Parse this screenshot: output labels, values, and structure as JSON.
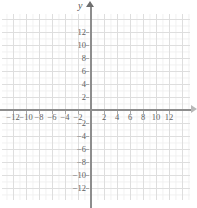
{
  "figure": {
    "kind": "coordinate-plane",
    "axis_label_y": "y",
    "axis_label_x": ""
  },
  "chart_data": {
    "type": "scatter",
    "title": "",
    "xlabel": "",
    "ylabel": "y",
    "xlim": [
      -13.6,
      14.5
    ],
    "ylim": [
      -13.8,
      14.6
    ],
    "grid": true,
    "grid_major_step": 2,
    "grid_minor_step": 1,
    "legend": "none",
    "series": [],
    "x_ticks": [
      -12,
      -10,
      -8,
      -6,
      -4,
      -2,
      2,
      4,
      6,
      8,
      10,
      12
    ],
    "y_ticks": [
      12,
      10,
      8,
      6,
      4,
      2,
      -2,
      -4,
      -6,
      -8,
      -10,
      -12
    ],
    "x_tick_labels": [
      "−12",
      "−10",
      "−8",
      "−6",
      "−4",
      "−2",
      "2",
      "4",
      "6",
      "8",
      "10",
      "12"
    ],
    "y_tick_labels": [
      "12",
      "10",
      "8",
      "6",
      "4",
      "2",
      "−2",
      "−4",
      "−6",
      "−8",
      "−10",
      "−12"
    ]
  },
  "colors": {
    "background": "#ffffff",
    "grid_major": "#dedede",
    "grid_minor": "#f0f0f0",
    "axis": "#8d8d8d",
    "tick_text": "#5f5f5f"
  }
}
